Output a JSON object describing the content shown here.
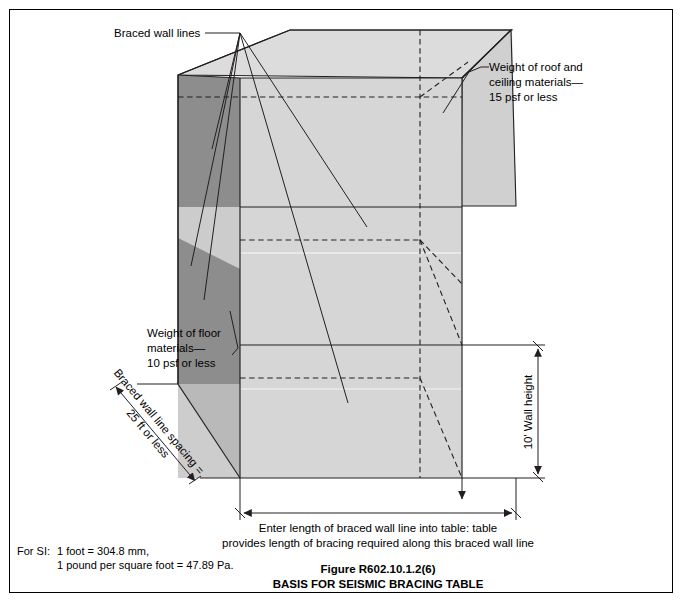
{
  "figure": {
    "number": "Figure R602.10.1.2(6)",
    "title": "BASIS FOR SEISMIC BRACING TABLE"
  },
  "annotations": {
    "braced_wall_lines": "Braced wall lines",
    "roof_ceiling": {
      "line1": "Weight of roof and",
      "line2": "ceiling materials—",
      "line3": "15 psf or less"
    },
    "floor": {
      "line1": "Weight of floor",
      "line2": "materials—",
      "line3": "10 psf or less"
    },
    "wall_height": "10' Wall height",
    "spacing": {
      "line1": "Braced wall line spacing =",
      "line2": "25 ft or less"
    },
    "bottom_dim": {
      "line1": "Enter length of braced wall line into table: table",
      "line2": "provides length of bracing required along this braced wall line"
    }
  },
  "si_note": {
    "label": "For SI:",
    "line1": "1 foot = 304.8 mm,",
    "line2": "1 pound per square foot = 47.89 Pa."
  },
  "colors": {
    "face_light": "#d6d6d6",
    "face_mid": "#cfcfcf",
    "face_dark": "#8d8d8d",
    "face_dark2": "#9a9a9a",
    "roof_top": "#dcdcdc",
    "line": "#231f20",
    "border": "#000000"
  },
  "icons": {
    "arrow": "dimension-arrow",
    "leader": "leader-line"
  }
}
